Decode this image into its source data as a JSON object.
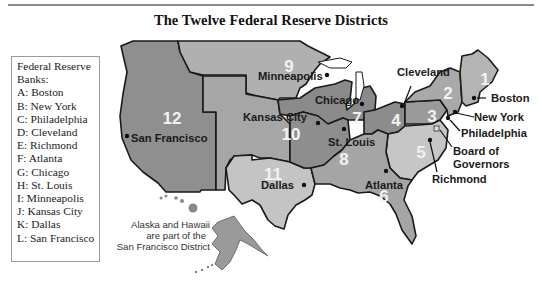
{
  "title": "The Twelve Federal Reserve Districts",
  "legend": {
    "heading_line1": "Federal Reserve",
    "heading_line2": "Banks:",
    "items": [
      {
        "key": "A",
        "label": "A: Boston"
      },
      {
        "key": "B",
        "label": "B: New York"
      },
      {
        "key": "C",
        "label": "C: Philadelphia"
      },
      {
        "key": "D",
        "label": "D: Cleveland"
      },
      {
        "key": "E",
        "label": "E: Richmond"
      },
      {
        "key": "F",
        "label": "F: Atlanta"
      },
      {
        "key": "G",
        "label": "G: Chicago"
      },
      {
        "key": "H",
        "label": "H: St. Louis"
      },
      {
        "key": "I",
        "label": "I: Minneapolis"
      },
      {
        "key": "J",
        "label": "J: Kansas City"
      },
      {
        "key": "K",
        "label": "K: Dallas"
      },
      {
        "key": "L",
        "label": "L: San Francisco"
      }
    ]
  },
  "districts": [
    {
      "number": "1",
      "city": "Boston",
      "shade": "#b4b4b4"
    },
    {
      "number": "2",
      "city": "New York",
      "shade": "#a9a9a9"
    },
    {
      "number": "3",
      "city": "Philadelphia",
      "shade": "#9a9a9a"
    },
    {
      "number": "4",
      "city": "Cleveland",
      "shade": "#8c8c8c"
    },
    {
      "number": "5",
      "city": "Richmond",
      "shade": "#c6c6c6"
    },
    {
      "number": "6",
      "city": "Atlanta",
      "shade": "#a5a5a5"
    },
    {
      "number": "7",
      "city": "Chicago",
      "shade": "#8a8a8a"
    },
    {
      "number": "8",
      "city": "St. Louis",
      "shade": "#8e8e8e"
    },
    {
      "number": "9",
      "city": "Minneapolis",
      "shade": "#b0b0b0"
    },
    {
      "number": "10",
      "city": "Kansas City",
      "shade": "#a6a6a6"
    },
    {
      "number": "11",
      "city": "Dallas",
      "shade": "#c4c4c4"
    },
    {
      "number": "12",
      "city": "San Francisco",
      "shade": "#8f8f8f"
    }
  ],
  "labels": {
    "board": "Board of",
    "board2": "Governors",
    "note1": "Alaska and Hawaii",
    "note2": "are part of the",
    "note3": "San Francisco District"
  }
}
